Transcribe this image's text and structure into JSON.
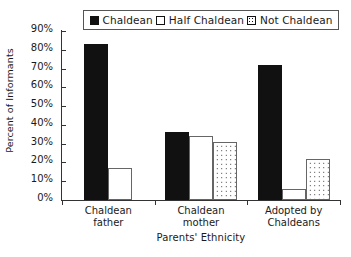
{
  "chart_data": {
    "type": "bar",
    "title": "",
    "subtitle": "",
    "xlabel": "Parents' Ethnicity",
    "ylabel": "Percent of Informants",
    "categories": [
      "Chaldean father",
      "Chaldean mother",
      "Adopted by Chaldeans"
    ],
    "category_lines": [
      [
        "Chaldean",
        "father"
      ],
      [
        "Chaldean",
        "mother"
      ],
      [
        "Adopted by",
        "Chaldeans"
      ]
    ],
    "series": [
      {
        "name": "Chaldean",
        "pattern": "solid",
        "values": [
          83,
          36,
          72
        ]
      },
      {
        "name": "Half Chaldean",
        "pattern": "empty",
        "values": [
          17,
          34,
          6
        ]
      },
      {
        "name": "Not Chaldean",
        "pattern": "dotted",
        "values": [
          0,
          31,
          22
        ]
      }
    ],
    "ylim": [
      0,
      90
    ],
    "ytick_values": [
      0,
      10,
      20,
      30,
      40,
      50,
      60,
      70,
      80,
      90
    ],
    "ytick_labels": [
      "0%",
      "10%",
      "20%",
      "30%",
      "40%",
      "50%",
      "60%",
      "70%",
      "80%",
      "90%"
    ],
    "grid": false,
    "legend_position": "top"
  },
  "legend": {
    "entries": [
      {
        "label": "Chaldean",
        "swatch": "solid-square-icon"
      },
      {
        "label": "Half Chaldean",
        "swatch": "empty-square-icon"
      },
      {
        "label": "Not Chaldean",
        "swatch": "dotted-square-icon"
      }
    ]
  },
  "axes": {
    "y_title": "Percent of Informants",
    "x_title": "Parents' Ethnicity"
  }
}
